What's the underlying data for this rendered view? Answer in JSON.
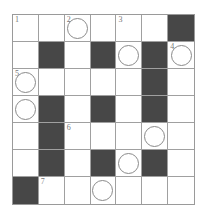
{
  "puzzle": {
    "rows": 7,
    "cols": 7,
    "colors": {
      "black_cell": "#474747",
      "grid_line": "#a0a0a0",
      "circle": "#8a8a8a"
    },
    "cells": [
      [
        {
          "t": "w",
          "n": "1"
        },
        {
          "t": "w"
        },
        {
          "t": "w",
          "n": "2",
          "c": true
        },
        {
          "t": "w"
        },
        {
          "t": "w",
          "n": "3"
        },
        {
          "t": "w"
        },
        {
          "t": "b"
        }
      ],
      [
        {
          "t": "w"
        },
        {
          "t": "b"
        },
        {
          "t": "w"
        },
        {
          "t": "b"
        },
        {
          "t": "w",
          "c": true
        },
        {
          "t": "b"
        },
        {
          "t": "w",
          "n": "4",
          "c": true
        }
      ],
      [
        {
          "t": "w",
          "n": "5",
          "c": true
        },
        {
          "t": "w"
        },
        {
          "t": "w"
        },
        {
          "t": "w"
        },
        {
          "t": "w"
        },
        {
          "t": "b"
        },
        {
          "t": "w"
        }
      ],
      [
        {
          "t": "w",
          "c": true
        },
        {
          "t": "b"
        },
        {
          "t": "w"
        },
        {
          "t": "b"
        },
        {
          "t": "w"
        },
        {
          "t": "b"
        },
        {
          "t": "w"
        }
      ],
      [
        {
          "t": "w"
        },
        {
          "t": "b"
        },
        {
          "t": "w",
          "n": "6"
        },
        {
          "t": "w"
        },
        {
          "t": "w"
        },
        {
          "t": "w",
          "c": true
        },
        {
          "t": "w"
        }
      ],
      [
        {
          "t": "w"
        },
        {
          "t": "b"
        },
        {
          "t": "w"
        },
        {
          "t": "b"
        },
        {
          "t": "w",
          "c": true
        },
        {
          "t": "b"
        },
        {
          "t": "w"
        }
      ],
      [
        {
          "t": "b"
        },
        {
          "t": "w",
          "n": "7"
        },
        {
          "t": "w"
        },
        {
          "t": "w",
          "c": true
        },
        {
          "t": "w"
        },
        {
          "t": "w"
        },
        {
          "t": "w"
        }
      ]
    ]
  }
}
